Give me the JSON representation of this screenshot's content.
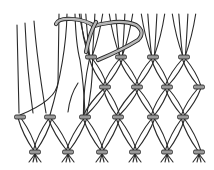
{
  "figure": {
    "colors": {
      "line": "#2a2a2a",
      "knot_fill": "#9a9a9a",
      "working_cord_fill": "#b8b8b8",
      "background": "#ffffff"
    },
    "knot_rows": [
      {
        "y": 57,
        "x": [
          91,
          121,
          153,
          184
        ]
      },
      {
        "y": 87,
        "x": [
          105,
          137,
          167,
          199
        ]
      },
      {
        "y": 117,
        "x": [
          20,
          50,
          85,
          118,
          153,
          183
        ]
      },
      {
        "y": 152,
        "x": [
          35,
          68,
          102,
          135,
          167,
          199
        ]
      }
    ],
    "knot_size": {
      "w": 11,
      "h": 4
    },
    "loose_strands_left": 3,
    "working_cord": "curved threading cord at top passing through first knots"
  }
}
